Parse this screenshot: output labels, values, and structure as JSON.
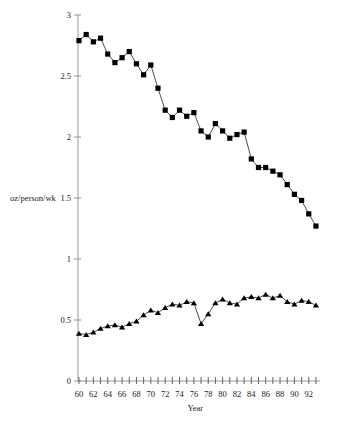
{
  "chart_data": {
    "type": "line",
    "title": "",
    "xlabel": "Year",
    "ylabel": "oz/person/wk",
    "xlim": [
      59.5,
      93.5
    ],
    "ylim": [
      0,
      3
    ],
    "yticks": [
      "0",
      "0.5",
      "1",
      "1.5",
      "2",
      "2.5",
      "3"
    ],
    "ytick_values": [
      0,
      0.5,
      1,
      1.5,
      2,
      2.5,
      3
    ],
    "xticks": [
      "60",
      "62",
      "64",
      "66",
      "68",
      "70",
      "72",
      "74",
      "76",
      "78",
      "80",
      "82",
      "84",
      "86",
      "88",
      "90",
      "92"
    ],
    "xtick_values": [
      60,
      62,
      64,
      66,
      68,
      70,
      72,
      74,
      76,
      78,
      80,
      82,
      84,
      86,
      88,
      90,
      92
    ],
    "xtick_minor_values": [
      61,
      63,
      65,
      67,
      69,
      71,
      73,
      75,
      77,
      79,
      81,
      83,
      85,
      87,
      89,
      91,
      93
    ],
    "grid": false,
    "legend_position": "none",
    "x": [
      60,
      61,
      62,
      63,
      64,
      65,
      66,
      67,
      68,
      69,
      70,
      71,
      72,
      73,
      74,
      75,
      76,
      77,
      78,
      79,
      80,
      81,
      82,
      83,
      84,
      85,
      86,
      87,
      88,
      89,
      90,
      91,
      92,
      93
    ],
    "series": [
      {
        "name": "series-squares",
        "marker": "square",
        "color": "#000000",
        "values": [
          2.79,
          2.84,
          2.78,
          2.81,
          2.68,
          2.61,
          2.65,
          2.7,
          2.6,
          2.51,
          2.59,
          2.4,
          2.22,
          2.16,
          2.22,
          2.17,
          2.2,
          2.05,
          2.0,
          2.11,
          2.05,
          1.99,
          2.02,
          2.04,
          1.82,
          1.75,
          1.75,
          1.72,
          1.69,
          1.61,
          1.53,
          1.48,
          1.37,
          1.27
        ]
      },
      {
        "name": "series-triangles",
        "marker": "triangle",
        "color": "#000000",
        "values": [
          0.39,
          0.38,
          0.4,
          0.43,
          0.45,
          0.46,
          0.44,
          0.47,
          0.49,
          0.54,
          0.58,
          0.56,
          0.6,
          0.63,
          0.62,
          0.65,
          0.64,
          0.47,
          0.55,
          0.64,
          0.67,
          0.64,
          0.63,
          0.68,
          0.69,
          0.68,
          0.71,
          0.68,
          0.7,
          0.65,
          0.63,
          0.66,
          0.65,
          0.62
        ]
      }
    ]
  },
  "axes": {
    "y_axis_label": "oz/person/wk",
    "x_axis_label": "Year"
  }
}
